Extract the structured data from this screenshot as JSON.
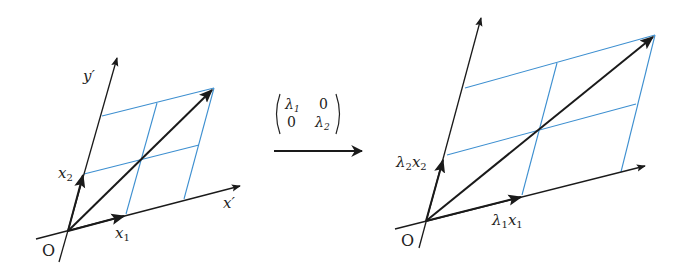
{
  "colors": {
    "axis": "#1a1a1a",
    "grid": "#3d8fd0",
    "background": "#ffffff"
  },
  "left_figure": {
    "origin_label": "O",
    "x_axis_label": "x′",
    "y_axis_label": "y′",
    "vector1_label": "x",
    "vector1_sub": "1",
    "vector2_label": "x",
    "vector2_sub": "2"
  },
  "transform": {
    "matrix": [
      [
        "λ1",
        "0"
      ],
      [
        "0",
        "λ2"
      ]
    ],
    "m11": "λ",
    "m11_sub": "1",
    "m12": "0",
    "m21": "0",
    "m22": "λ",
    "m22_sub": "2"
  },
  "right_figure": {
    "origin_label": "O",
    "vector1_label": "λ",
    "vector1_sub": "1",
    "vector1_var": "x",
    "vector1_var_sub": "1",
    "vector2_label": "λ",
    "vector2_sub": "2",
    "vector2_var": "x",
    "vector2_var_sub": "2"
  }
}
